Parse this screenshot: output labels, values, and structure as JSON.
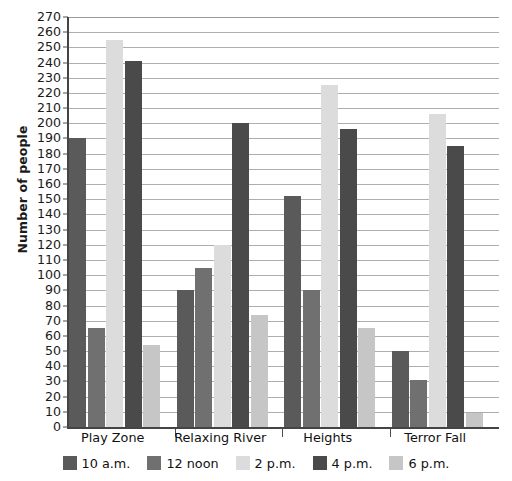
{
  "chart_data": {
    "type": "bar",
    "title": "",
    "xlabel": "",
    "ylabel": "Number of people",
    "ylim": [
      0,
      270
    ],
    "ytick_step": 10,
    "grid": true,
    "legend_position": "bottom",
    "categories": [
      "Play Zone",
      "Relaxing River",
      "Heights",
      "Terror Fall"
    ],
    "ytick_labels": [
      "270",
      "260",
      "250",
      "240",
      "230",
      "220",
      "210",
      "200",
      "190",
      "180",
      "170",
      "160",
      "150",
      "140",
      "130",
      "120",
      "110",
      "100",
      "90",
      "80",
      "70",
      "60",
      "50",
      "40",
      "30",
      "20",
      "10",
      "0"
    ],
    "series": [
      {
        "name": "10 a.m.",
        "color": "#5a5a5a",
        "values": [
          190,
          90,
          152,
          50
        ]
      },
      {
        "name": "12 noon",
        "color": "#707070",
        "values": [
          65,
          105,
          90,
          31
        ]
      },
      {
        "name": "2 p.m.",
        "color": "#dcdcdc",
        "values": [
          255,
          120,
          225,
          206
        ]
      },
      {
        "name": "4 p.m.",
        "color": "#4a4a4a",
        "values": [
          241,
          200,
          196,
          185
        ]
      },
      {
        "name": "6 p.m.",
        "color": "#c6c6c6",
        "values": [
          54,
          74,
          65,
          9
        ]
      }
    ]
  },
  "colors": {
    "axis": "#444444",
    "gridline": "#aeaeae",
    "text": "#111111",
    "background": "#ffffff"
  }
}
